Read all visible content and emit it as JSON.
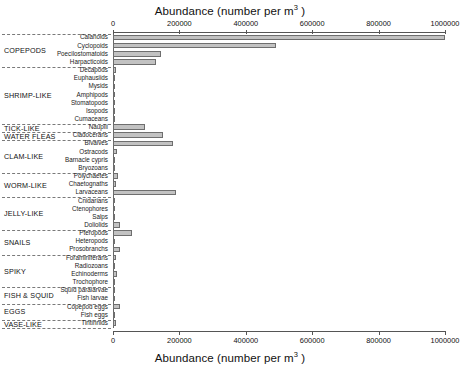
{
  "chart_data": {
    "type": "bar",
    "orientation": "horizontal",
    "title": "",
    "xlabel": "Abundance (number per m3 )",
    "xlabel_text": "Abundance (number per m",
    "xlabel_sup": "3",
    "xlabel_tail": " )",
    "ylabel": "",
    "xlim": [
      0,
      1000000
    ],
    "grid": false,
    "legend": "none",
    "axis_top": true,
    "axis_bottom": true,
    "tick_values": [
      0,
      200000,
      400000,
      600000,
      800000,
      1000000
    ],
    "tick_labels": [
      "0",
      "200000",
      "400000",
      "600000",
      "800000",
      "1000000"
    ],
    "bar_color": "#c2c2c2",
    "bar_edge_color": "#6e6e6e",
    "categories": [
      "Calanoids",
      "Cyclopoids",
      "Poecilostomatoids",
      "Harpacticoids",
      "Decapods",
      "Euphausiids",
      "Mysids",
      "Amphipods",
      "Stomatopods",
      "Isopods",
      "Cumaceans",
      "Nauplii",
      "Cladocerans",
      "Bivalves",
      "Ostracods",
      "Barnacle cypris",
      "Bryozoans",
      "Polychaetes",
      "Chaetognaths",
      "Larvaceans",
      "Cnidarians",
      "Ctenophores",
      "Salps",
      "Doliolids",
      "Pteropods",
      "Heteropods",
      "Prosobranchs",
      "Foraminiferans",
      "Radiozoans",
      "Echinoderms",
      "Trochophore",
      "Squid paralarvae",
      "Fish larvae",
      "Copepod eggs",
      "Fish eggs",
      "Tintinnids"
    ],
    "values": [
      1000000,
      490000,
      145000,
      130000,
      9000,
      3500,
      2500,
      2000,
      1200,
      2200,
      1500,
      95000,
      150000,
      180000,
      11000,
      2500,
      1500,
      14000,
      8000,
      190000,
      3000,
      1500,
      3000,
      22000,
      58000,
      2500,
      20000,
      9000,
      2000,
      12000,
      2500,
      2000,
      4000,
      22000,
      3500,
      9000
    ],
    "groups": [
      {
        "label": "COPEPODS",
        "start": 0,
        "end": 3
      },
      {
        "label": "SHRIMP-LIKE",
        "start": 4,
        "end": 10
      },
      {
        "label": "TICK-LIKE",
        "start": 11,
        "end": 11
      },
      {
        "label": "WATER FLEAS",
        "start": 12,
        "end": 12
      },
      {
        "label": "CLAM-LIKE",
        "start": 13,
        "end": 16
      },
      {
        "label": "WORM-LIKE",
        "start": 17,
        "end": 19
      },
      {
        "label": "JELLY-LIKE",
        "start": 20,
        "end": 23
      },
      {
        "label": "SNAILS",
        "start": 24,
        "end": 26
      },
      {
        "label": "SPIKY",
        "start": 27,
        "end": 30
      },
      {
        "label": "FISH & SQUID",
        "start": 31,
        "end": 32
      },
      {
        "label": "EGGS",
        "start": 33,
        "end": 34
      },
      {
        "label": "VASE-LIKE",
        "start": 35,
        "end": 35
      }
    ]
  }
}
